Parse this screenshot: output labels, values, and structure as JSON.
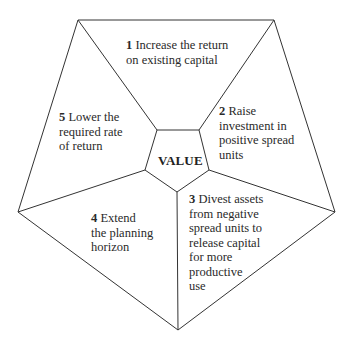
{
  "diagram": {
    "center_label": "VALUE",
    "line_color": "#333333",
    "segments": [
      {
        "number": "1",
        "lines": [
          "Increase the return",
          "on existing capital"
        ]
      },
      {
        "number": "2",
        "lines": [
          "Raise",
          "investment in",
          "positive spread",
          "units"
        ]
      },
      {
        "number": "3",
        "lines": [
          "Divest assets",
          "from negative",
          "spread units to",
          "release capital",
          "for more",
          "productive",
          "use"
        ]
      },
      {
        "number": "4",
        "lines": [
          "Extend",
          "the planning",
          "horizon"
        ]
      },
      {
        "number": "5",
        "lines": [
          "Lower the",
          "required rate",
          "of return"
        ]
      }
    ]
  }
}
